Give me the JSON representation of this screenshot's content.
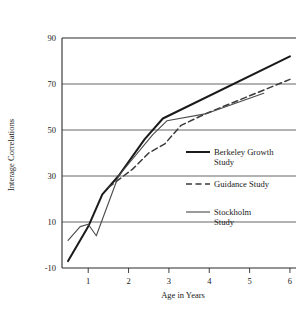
{
  "chart_data": {
    "type": "line",
    "title": "",
    "xlabel": "Age in Years",
    "ylabel": "Interage Correlations",
    "xlim": [
      0.35,
      6.15
    ],
    "ylim": [
      -10,
      90
    ],
    "xticks": [
      1,
      2,
      3,
      4,
      5,
      6
    ],
    "xtick_labels": [
      "1",
      "2",
      "3",
      "4",
      "5",
      "6"
    ],
    "yticks": [
      -10,
      10,
      30,
      50,
      70,
      90
    ],
    "ytick_labels": [
      "-10",
      "10",
      "30",
      "50",
      "70",
      "90"
    ],
    "grid": "horizontal",
    "legend_position": "center-right",
    "series": [
      {
        "name": "Berkeley Growth Study",
        "style": "solid-thick",
        "color": "#1a1a1a",
        "points": [
          {
            "x": 0.5,
            "y": -7
          },
          {
            "x": 1.0,
            "y": 8
          },
          {
            "x": 1.35,
            "y": 22
          },
          {
            "x": 1.75,
            "y": 30
          },
          {
            "x": 2.4,
            "y": 46
          },
          {
            "x": 2.85,
            "y": 55
          },
          {
            "x": 6.0,
            "y": 82
          }
        ]
      },
      {
        "name": "Guidance Study",
        "style": "dashed",
        "color": "#3a3a3a",
        "points": [
          {
            "x": 1.5,
            "y": 25
          },
          {
            "x": 2.1,
            "y": 33
          },
          {
            "x": 2.5,
            "y": 40
          },
          {
            "x": 2.9,
            "y": 44
          },
          {
            "x": 3.3,
            "y": 52
          },
          {
            "x": 3.9,
            "y": 57
          },
          {
            "x": 6.0,
            "y": 72
          }
        ]
      },
      {
        "name": "Stockholm Study",
        "style": "solid-thin",
        "color": "#4a4a4a",
        "points": [
          {
            "x": 0.5,
            "y": 2
          },
          {
            "x": 0.8,
            "y": 8
          },
          {
            "x": 1.0,
            "y": 9
          },
          {
            "x": 1.2,
            "y": 4
          },
          {
            "x": 1.75,
            "y": 30
          },
          {
            "x": 2.6,
            "y": 48
          },
          {
            "x": 2.95,
            "y": 54
          },
          {
            "x": 3.9,
            "y": 57
          },
          {
            "x": 5.35,
            "y": 66
          }
        ]
      }
    ],
    "legend": [
      {
        "label_line1": "Berkeley Growth",
        "label_line2": "Study",
        "style": "solid-thick"
      },
      {
        "label_line1": "Guidance Study",
        "label_line2": "",
        "style": "dashed"
      },
      {
        "label_line1": "Stockholm",
        "label_line2": "Study",
        "style": "solid-thin"
      }
    ]
  }
}
